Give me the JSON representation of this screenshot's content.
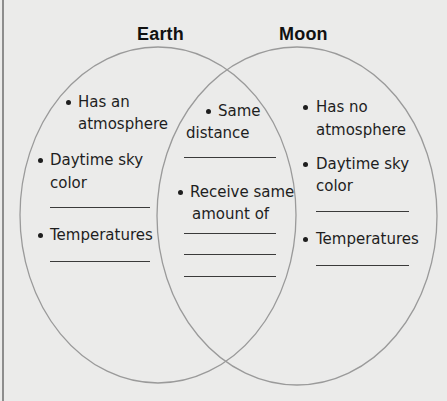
{
  "diagram": {
    "type": "venn",
    "sets": [
      {
        "id": "earth",
        "title": "Earth",
        "items": [
          {
            "lines": [
              "Has an",
              "atmosphere"
            ],
            "blank_lines": 0
          },
          {
            "lines": [
              "Daytime sky",
              "color"
            ],
            "blank_lines": 1
          },
          {
            "lines": [
              "Temperatures"
            ],
            "blank_lines": 1
          }
        ]
      },
      {
        "id": "both",
        "title": "",
        "items": [
          {
            "lines": [
              "Same",
              "distance"
            ],
            "blank_lines": 1
          },
          {
            "lines": [
              "Receive same",
              "amount of"
            ],
            "blank_lines": 3
          }
        ]
      },
      {
        "id": "moon",
        "title": "Moon",
        "items": [
          {
            "lines": [
              "Has no",
              "atmosphere"
            ],
            "blank_lines": 0
          },
          {
            "lines": [
              "Daytime sky",
              "color"
            ],
            "blank_lines": 1
          },
          {
            "lines": [
              "Temperatures"
            ],
            "blank_lines": 1
          }
        ]
      }
    ],
    "colors": {
      "background": "#ebebea",
      "circle_stroke": "#9a9a9a",
      "text": "#1e1e1e",
      "blank_line": "#3a3a3a"
    }
  }
}
